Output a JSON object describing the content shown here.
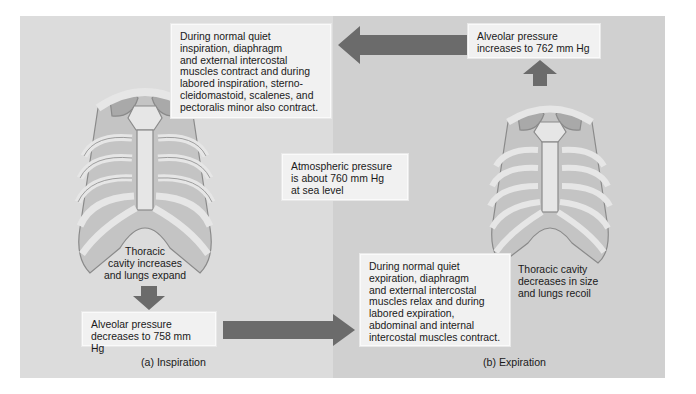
{
  "figure": {
    "panels": [
      {
        "id": "inspiration",
        "caption": "(a) Inspiration",
        "muscle_note": "During normal quiet\ninspiration, diaphragm\nand external intercostal\nmuscles contract and during\nlabored inspiration, sterno-\ncleidomastoid, scalenes, and\npectoralis minor also contract.",
        "cavity_note": "Thoracic\ncavity increases\nand lungs expand",
        "alveolar_pressure": "Alveolar pressure\ndecreases to 758 mm Hg"
      },
      {
        "id": "expiration",
        "caption": "(b) Expiration",
        "muscle_note": "During normal quiet\nexpiration, diaphragm\nand external intercostal\nmuscles relax and during\nlabored expiration,\nabdominal and internal\nintercostal muscles contract.",
        "cavity_note": "Thoracic cavity\ndecreases in size\nand lungs recoil",
        "alveolar_pressure": "Alveolar pressure\nincreases to 762 mm Hg"
      }
    ],
    "atmospheric_note": "Atmospheric pressure\nis about 760 mm Hg\nat sea level",
    "colors": {
      "panel_a_bg": "#dcdcdc",
      "panel_b_bg": "#d0d0d0",
      "arrow": "#6b6b6b",
      "box_bg": "#f1f1f1",
      "bone": "#e6e6e6",
      "lung": "#bdbdbd",
      "outline": "#8a8a8a"
    }
  }
}
